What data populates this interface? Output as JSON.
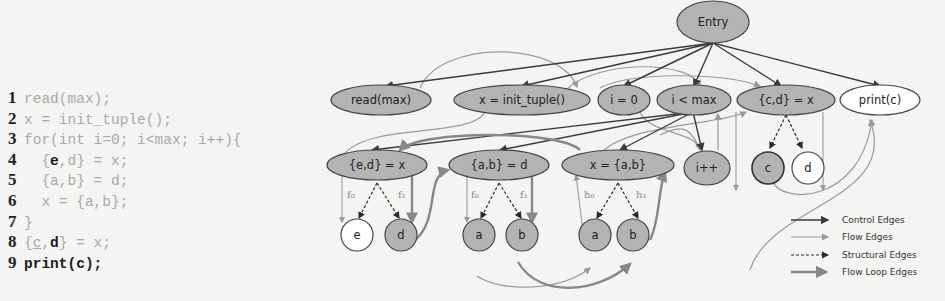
{
  "code": {
    "lines": [
      {
        "num": "1",
        "text": "read(max);"
      },
      {
        "num": "2",
        "text": "x = init_tuple();"
      },
      {
        "num": "3",
        "text": "for(int i=0; i<max; i++){"
      },
      {
        "num": "4",
        "pre": "  {",
        "bold": "e",
        "post": ",d} = x;"
      },
      {
        "num": "5",
        "text": "  {a,b} = d;"
      },
      {
        "num": "6",
        "text": "  x = {a,b};"
      },
      {
        "num": "7",
        "text": "}"
      },
      {
        "num": "8",
        "pre": "{",
        "underline": "c",
        "mid": ",",
        "bold": "d",
        "post": "} = x;"
      },
      {
        "num": "9",
        "bold_all": "print(c);"
      }
    ]
  },
  "graph": {
    "nodes": {
      "entry": "Entry",
      "read_max": "read(max)",
      "x_init": "x = init_tuple()",
      "i_eq_0": "i = 0",
      "i_lt_max": "i < max",
      "cd_eq_x": "{c,d} = x",
      "print_c": "print(c)",
      "ed_eq_x": "{e,d} = x",
      "ab_eq_d": "{a,b} = d",
      "x_eq_ab": "x = {a,b}",
      "i_inc": "i++",
      "leaf_c": "c",
      "leaf_d2": "d",
      "leaf_e": "e",
      "leaf_d": "d",
      "leaf_a1": "a",
      "leaf_b1": "b",
      "leaf_a2": "a",
      "leaf_b2": "b"
    },
    "field_labels": {
      "f0": "f₀",
      "f1": "f₁",
      "h0": "h₀",
      "h1": "h₁"
    },
    "colors": {
      "filled": "#b3b3b3",
      "unfilled": "#ffffff",
      "control": "#3a3a3a",
      "flow": "#9a9a9a",
      "structural": "#2a2a2a",
      "flow_loop": "#888888"
    }
  },
  "legend": {
    "items": [
      {
        "label": "Control Edges"
      },
      {
        "label": "Flow Edges"
      },
      {
        "label": "Structural Edges"
      },
      {
        "label": "Flow Loop Edges"
      }
    ]
  }
}
